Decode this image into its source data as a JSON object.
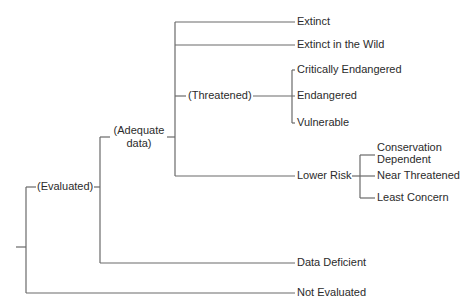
{
  "diagram": {
    "type": "tree",
    "nodes": {
      "evaluated": "(Evaluated)",
      "adequate_data_line1": "(Adequate",
      "adequate_data_line2": "data)",
      "threatened": "(Threatened)",
      "extinct": "Extinct",
      "extinct_in_the_wild": "Extinct in the Wild",
      "critically_endangered": "Critically Endangered",
      "endangered": "Endangered",
      "vulnerable": "Vulnerable",
      "lower_risk": "Lower Risk",
      "conservation_dependent_line1": "Conservation",
      "conservation_dependent_line2": "Dependent",
      "near_threatened": "Near Threatened",
      "least_concern": "Least Concern",
      "data_deficient": "Data Deficient",
      "not_evaluated": "Not Evaluated"
    },
    "structure": [
      {
        "label": "(Evaluated)",
        "children": [
          {
            "label": "(Adequate data)",
            "children": [
              {
                "label": "Extinct"
              },
              {
                "label": "Extinct in the Wild"
              },
              {
                "label": "(Threatened)",
                "children": [
                  {
                    "label": "Critically Endangered"
                  },
                  {
                    "label": "Endangered"
                  },
                  {
                    "label": "Vulnerable"
                  }
                ]
              },
              {
                "label": "Lower Risk",
                "children": [
                  {
                    "label": "Conservation Dependent"
                  },
                  {
                    "label": "Near Threatened"
                  },
                  {
                    "label": "Least Concern"
                  }
                ]
              }
            ]
          },
          {
            "label": "Data Deficient"
          }
        ]
      },
      {
        "label": "Not Evaluated"
      }
    ],
    "colors": {
      "line": "#6a6a6a",
      "text": "#2b2b2b",
      "background": "#ffffff"
    }
  }
}
